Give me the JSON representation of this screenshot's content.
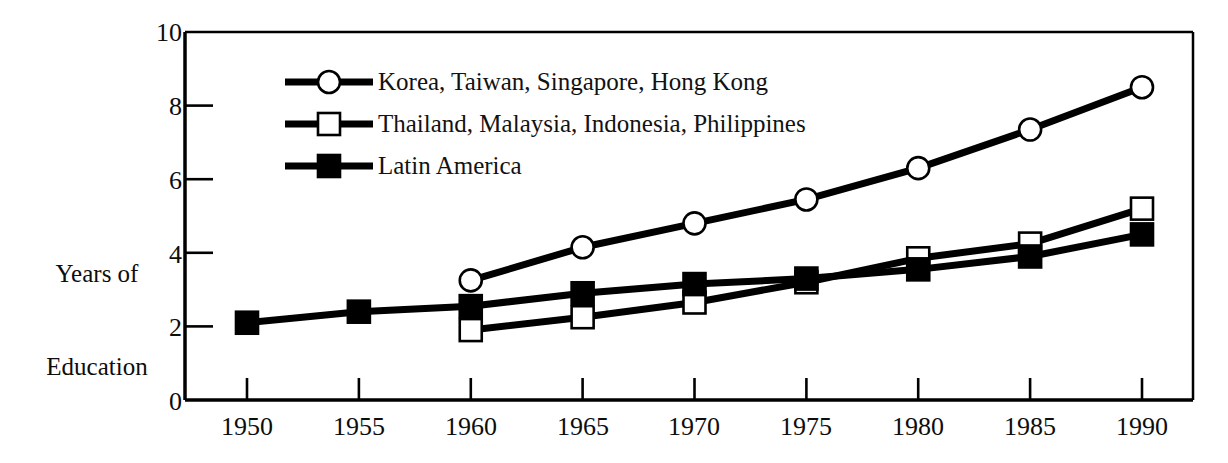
{
  "chart_data": {
    "type": "line",
    "title": "",
    "xlabel": "",
    "ylabel": "Years of\nEducation",
    "ylabel_line1": "Years of",
    "ylabel_line2": "Education",
    "x": [
      1950,
      1955,
      1960,
      1965,
      1970,
      1975,
      1980,
      1985,
      1990
    ],
    "xtick_labels": [
      "1950",
      "1955",
      "1960",
      "1965",
      "1970",
      "1975",
      "1980",
      "1985",
      "1990"
    ],
    "ytick_labels": [
      "0",
      "2",
      "4",
      "6",
      "8",
      "10"
    ],
    "yticks": [
      0,
      2,
      4,
      6,
      8,
      10
    ],
    "xlim": [
      1948,
      1990
    ],
    "ylim": [
      0,
      10
    ],
    "grid": false,
    "legend_position": "upper-left-inside",
    "series": [
      {
        "name": "Korea, Taiwan, Singapore, Hong Kong",
        "marker": "open-circle",
        "color": "#000000",
        "x": [
          1960,
          1965,
          1970,
          1975,
          1980,
          1985,
          1990
        ],
        "values": [
          3.25,
          4.15,
          4.8,
          5.45,
          6.3,
          7.35,
          8.5
        ]
      },
      {
        "name": "Thailand, Malaysia, Indonesia, Philippines",
        "marker": "open-square",
        "color": "#000000",
        "x": [
          1960,
          1965,
          1970,
          1975,
          1980,
          1985,
          1990
        ],
        "values": [
          1.9,
          2.25,
          2.65,
          3.2,
          3.85,
          4.25,
          5.2
        ]
      },
      {
        "name": "Latin America",
        "marker": "filled-square",
        "color": "#000000",
        "x": [
          1950,
          1955,
          1960,
          1965,
          1970,
          1975,
          1980,
          1985,
          1990
        ],
        "values": [
          2.1,
          2.4,
          2.55,
          2.9,
          3.15,
          3.3,
          3.55,
          3.9,
          4.5
        ]
      }
    ]
  },
  "legend": {
    "items": [
      {
        "label": "Korea, Taiwan, Singapore, Hong Kong",
        "marker": "open-circle"
      },
      {
        "label": "Thailand, Malaysia, Indonesia, Philippines",
        "marker": "open-square"
      },
      {
        "label": "Latin America",
        "marker": "filled-square"
      }
    ]
  },
  "axes": {
    "y_title_line1": "Years of",
    "y_title_line2": "Education",
    "ytick_0": "0",
    "ytick_2": "2",
    "ytick_4": "4",
    "ytick_6": "6",
    "ytick_8": "8",
    "ytick_10": "10",
    "xtick_1950": "1950",
    "xtick_1955": "1955",
    "xtick_1960": "1960",
    "xtick_1965": "1965",
    "xtick_1970": "1970",
    "xtick_1975": "1975",
    "xtick_1980": "1980",
    "xtick_1985": "1985",
    "xtick_1990": "1990"
  },
  "colors": {
    "ink": "#000000",
    "background": "#ffffff"
  }
}
